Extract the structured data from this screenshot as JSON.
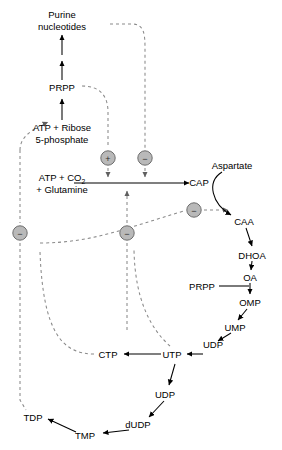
{
  "diagram": {
    "colors": {
      "solid_edge": "#000000",
      "dashed_edge": "#8a8a8a",
      "circle_fill": "#b9b9b9",
      "circle_stroke": "#6d6d6d",
      "text": "#000000",
      "background": "#ffffff"
    },
    "nodes": [
      {
        "id": "purine",
        "label_line1": "Purine",
        "label_line2": "nucleotides",
        "x": 62,
        "y": 18
      },
      {
        "id": "prpp_top",
        "label": "PRPP",
        "x": 62,
        "y": 88
      },
      {
        "id": "atp_rib",
        "label_line1": "ATP + Ribose",
        "label_line2": "5-phosphate",
        "x": 62,
        "y": 128
      },
      {
        "id": "atp_co2",
        "label_line1": "ATP + CO",
        "label_sub": "2",
        "label_line2": "+ Glutamine",
        "x": 62,
        "y": 178
      },
      {
        "id": "cap",
        "label": "CAP",
        "x": 199,
        "y": 183
      },
      {
        "id": "aspartate",
        "label": "Aspartate",
        "x": 232,
        "y": 166
      },
      {
        "id": "caa",
        "label": "CAA",
        "x": 244,
        "y": 222
      },
      {
        "id": "dhoa",
        "label": "DHOA",
        "x": 252,
        "y": 256
      },
      {
        "id": "oa",
        "label": "OA",
        "x": 250,
        "y": 279
      },
      {
        "id": "prpp_mid",
        "label": "PRPP",
        "x": 202,
        "y": 289
      },
      {
        "id": "omp",
        "label": "OMP",
        "x": 250,
        "y": 303
      },
      {
        "id": "ump",
        "label": "UMP",
        "x": 235,
        "y": 328
      },
      {
        "id": "udp_top",
        "label": "UDP",
        "x": 213,
        "y": 345
      },
      {
        "id": "utp",
        "label": "UTP",
        "x": 172,
        "y": 357
      },
      {
        "id": "ctp",
        "label": "CTP",
        "x": 108,
        "y": 357
      },
      {
        "id": "udp_low",
        "label": "UDP",
        "x": 165,
        "y": 395
      },
      {
        "id": "dudp",
        "label": "dUDP",
        "x": 138,
        "y": 425
      },
      {
        "id": "tmp",
        "label": "TMP",
        "x": 85,
        "y": 436
      },
      {
        "id": "tdp",
        "label": "TDP",
        "x": 33,
        "y": 418
      }
    ],
    "regulators": [
      {
        "id": "reg-activate-prpp",
        "sign": "+",
        "type": "activation",
        "x": 108,
        "y": 158
      },
      {
        "id": "reg-inhibit-cap",
        "sign": "−",
        "type": "inhibition",
        "x": 145,
        "y": 158
      },
      {
        "id": "reg-inhibit-caa",
        "sign": "−",
        "type": "inhibition",
        "x": 194,
        "y": 210
      },
      {
        "id": "reg-inhibit-left",
        "sign": "−",
        "type": "inhibition",
        "x": 20,
        "y": 233
      },
      {
        "id": "reg-inhibit-mid",
        "sign": "−",
        "type": "inhibition",
        "x": 127,
        "y": 233
      }
    ],
    "solid_edges": [
      {
        "id": "purine-up-1",
        "from": "atp_rib_arrow",
        "d": "M62,120 L62,98"
      },
      {
        "id": "purine-up-2",
        "from": "prpp",
        "d": "M62,80 L62,62"
      },
      {
        "id": "purine-up-3",
        "from": "mid",
        "d": "M62,56 L62,36"
      },
      {
        "id": "atpco2-to-cap",
        "from": "atp_co2",
        "d": "M78,183 L190,183"
      },
      {
        "id": "aspartate-to-caa",
        "from": "aspartate",
        "d": "M223,172 C208,182 213,205 232,216"
      },
      {
        "id": "caa-dhoa",
        "from": "caa",
        "d": "M247,228 L252,247"
      },
      {
        "id": "dhoa-oa",
        "from": "dhoa",
        "d": "M252,261 L251,271"
      },
      {
        "id": "oa-omp",
        "from": "oa",
        "d": "M250,284 L250,295"
      },
      {
        "id": "prpp-omp",
        "from": "prpp_mid",
        "d": "M218,286 L249,286"
      },
      {
        "id": "omp-ump",
        "from": "omp",
        "d": "M247,309 L239,320"
      },
      {
        "id": "ump-udp",
        "from": "ump",
        "d": "M230,333 L219,340"
      },
      {
        "id": "udp-utp",
        "from": "udp_top",
        "d": "M203,354 L186,354"
      },
      {
        "id": "utp-ctp",
        "from": "utp",
        "d": "M162,354 L124,354"
      },
      {
        "id": "utp-udplow",
        "from": "utp",
        "d": "M174,364 L168,386"
      },
      {
        "id": "udplow-dudp",
        "from": "udp_low",
        "d": "M163,401 L148,418"
      },
      {
        "id": "dudp-tmp",
        "from": "dudp",
        "d": "M128,430 L102,433"
      },
      {
        "id": "tmp-tdp",
        "from": "tmp",
        "d": "M75,432 L47,418"
      }
    ],
    "dashed_edges": [
      {
        "id": "purine-feedback-to-cap",
        "d": "M110,24 L132,24 C144,24 145,34 145,48 L145,148"
      },
      {
        "id": "prpp-feedback-down",
        "d": "M82,86 C100,86 108,96 108,112 L108,148"
      },
      {
        "id": "atprib-left-loop",
        "d": "M20,150 L20,223"
      },
      {
        "id": "activate-arrow",
        "d": "M108,168 L108,176"
      },
      {
        "id": "inhibit-arrow-cap",
        "d": "M145,168 L145,176"
      },
      {
        "id": "utp-to-capsite",
        "d": "M127,243 L127,330"
      },
      {
        "id": "capsite-up-arrow",
        "d": "M127,223 L127,192"
      },
      {
        "id": "caa-inhibit-line",
        "d": "M40,243 C90,243 120,228 184,211"
      },
      {
        "id": "caa-inhibit-arrow",
        "d": "M204,210 L226,210"
      },
      {
        "id": "ctp-feedback-up",
        "d": "M92,354 C60,354 44,330 40,252"
      },
      {
        "id": "utp-feedback-up",
        "d": "M168,346 C150,330 135,300 135,250"
      },
      {
        "id": "tdp-feedback-up",
        "d": "M20,243 L20,402 L27,410"
      }
    ]
  }
}
